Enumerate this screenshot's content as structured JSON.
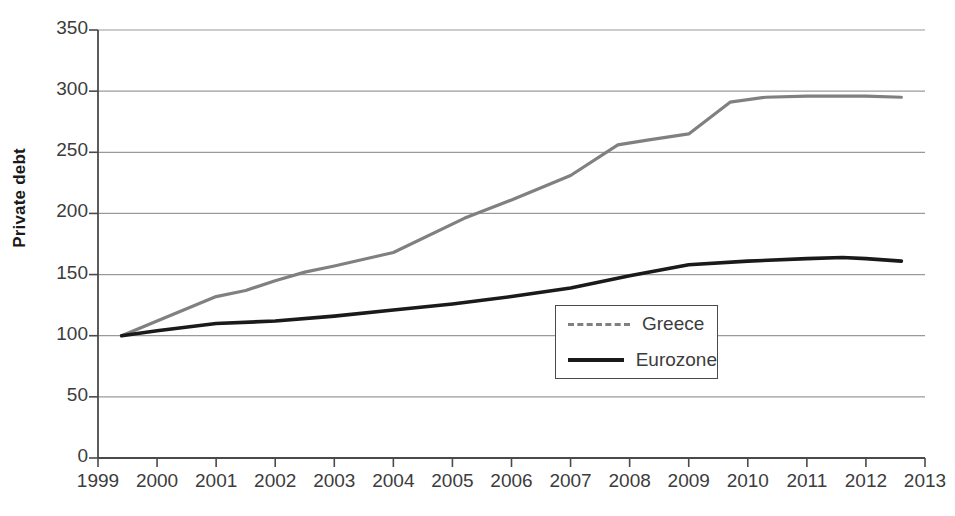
{
  "axis": {
    "ylabel": "Private debt",
    "yticks": [
      "0",
      "50",
      "100",
      "150",
      "200",
      "250",
      "300",
      "350"
    ],
    "xticks": [
      "1999",
      "2000",
      "2001",
      "2002",
      "2003",
      "2004",
      "2005",
      "2006",
      "2007",
      "2008",
      "2009",
      "2010",
      "2011",
      "2012",
      "2013"
    ]
  },
  "legend": {
    "position": "inside-center-right",
    "entries": [
      {
        "label": "Greece",
        "color": "#808080",
        "style": "dashed"
      },
      {
        "label": "Eurozone",
        "color": "#1a1a1a",
        "style": "solid"
      }
    ]
  },
  "colors": {
    "greece": "#808080",
    "eurozone": "#1a1a1a",
    "grid": "#9a9a9a",
    "axis": "#4a4a4a",
    "text": "#3c3c3c"
  },
  "chart_data": {
    "type": "line",
    "title": "",
    "xlabel": "",
    "ylabel": "Private debt",
    "xlim": [
      1999,
      2013
    ],
    "ylim": [
      0,
      350
    ],
    "ytick_step": 50,
    "grid": true,
    "legend_position": "inside-center-right",
    "series": [
      {
        "name": "Greece",
        "color": "#808080",
        "style": "dashed",
        "x": [
          1999.4,
          2000.0,
          2001.0,
          2001.5,
          2002.0,
          2002.5,
          2003.0,
          2004.0,
          2005.2,
          2006.0,
          2007.0,
          2007.8,
          2008.3,
          2009.0,
          2009.7,
          2010.3,
          2011.0,
          2012.0,
          2012.6
        ],
        "y": [
          100,
          112,
          132,
          137,
          145,
          152,
          157,
          168,
          196,
          211,
          231,
          256,
          260,
          265,
          291,
          295,
          296,
          296,
          295
        ]
      },
      {
        "name": "Eurozone",
        "color": "#1a1a1a",
        "style": "solid",
        "x": [
          1999.4,
          2000.0,
          2001.0,
          2002.0,
          2003.0,
          2004.0,
          2005.0,
          2006.0,
          2007.0,
          2008.0,
          2009.0,
          2010.0,
          2011.0,
          2011.6,
          2012.0,
          2012.6
        ],
        "y": [
          100,
          104,
          110,
          112,
          116,
          121,
          126,
          132,
          139,
          149,
          158,
          161,
          163,
          164,
          163,
          161
        ]
      }
    ]
  }
}
